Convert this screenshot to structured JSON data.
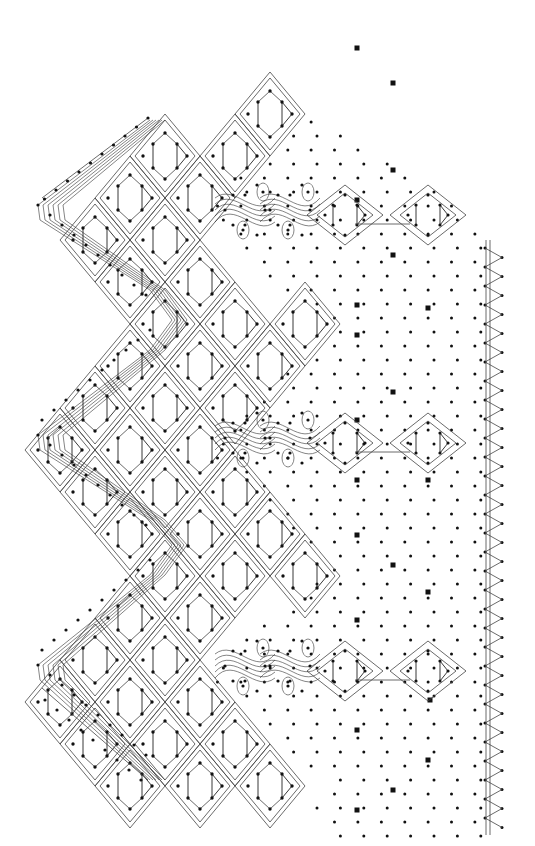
{
  "diagram": {
    "title": "",
    "type": "bobbin lace pricking (torchon edging)",
    "colors": {
      "ink": "#111111",
      "line": "#444444",
      "paper": "#ffffff"
    },
    "elements": {
      "headside": {
        "label": "zigzag headside with passive threads",
        "scallops": 3
      },
      "cloth_diamonds": {
        "label": "rose ground blocks with triangle pin groups",
        "count_per_repeat": 18
      },
      "spiders": {
        "label": "spider motifs",
        "count": 3
      },
      "trail_diamonds": {
        "label": "small diamond pair",
        "count": 6
      },
      "ground": {
        "label": "torchon ground pin holes"
      },
      "markers": {
        "label": "square marker pins"
      },
      "footside": {
        "label": "zigzag footside with double straight edge"
      }
    },
    "repeats": 3
  }
}
